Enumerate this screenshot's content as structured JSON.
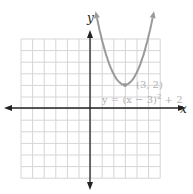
{
  "chart_data": {
    "type": "line",
    "title": "",
    "xlabel": "x",
    "ylabel": "y",
    "xlim": [
      -6,
      6
    ],
    "ylim": [
      -6,
      6
    ],
    "grid": true,
    "series": [
      {
        "name": "y = (x - 3)^2 + 2",
        "function": "(x-3)^2+2",
        "color": "#9a9a9a"
      }
    ],
    "annotations": [
      {
        "text": "(3, 2)",
        "x": 3,
        "y": 2
      },
      {
        "text": "y = (x − 3)² + 2"
      }
    ]
  },
  "labels": {
    "x_axis": "x",
    "y_axis": "y",
    "vertex": "(3, 2)",
    "equation_prefix": "y = (x − 3)",
    "equation_exp": "2",
    "equation_suffix": " + 2"
  },
  "colors": {
    "grid": "#d6d6d6",
    "axis": "#222222",
    "curve": "#9a9a9a",
    "text": "#b0b0b0"
  }
}
